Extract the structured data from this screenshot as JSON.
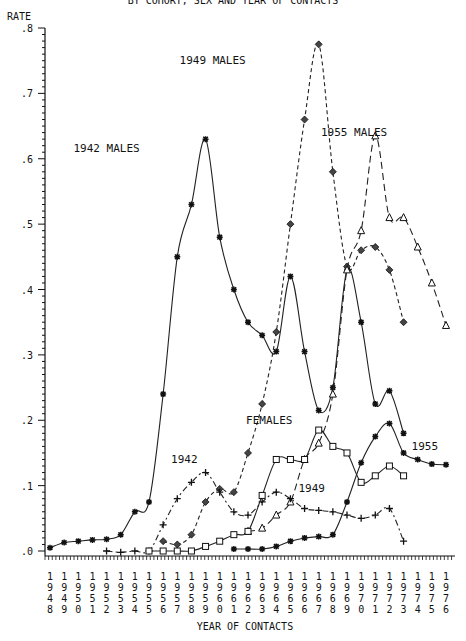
{
  "chart_data": {
    "type": "line",
    "title": "BY COHORT, SEX AND YEAR OF CONTACTS",
    "xlabel": "YEAR OF CONTACTS",
    "ylabel": "RATE",
    "ylim": [
      0,
      0.8
    ],
    "xlim": [
      1948,
      1976
    ],
    "grid": false,
    "y_ticks": [
      ".0",
      ".1",
      ".2",
      ".3",
      ".4",
      ".5",
      ".6",
      ".7",
      ".8"
    ],
    "x_ticks": [
      1948,
      1949,
      1950,
      1951,
      1952,
      1953,
      1954,
      1955,
      1956,
      1957,
      1958,
      1959,
      1960,
      1961,
      1962,
      1963,
      1964,
      1965,
      1966,
      1967,
      1968,
      1969,
      1970,
      1971,
      1972,
      1973,
      1974,
      1975,
      1976
    ],
    "annotations": [
      {
        "text": "1942 MALES",
        "x": 1952.0,
        "y": 0.61
      },
      {
        "text": "1949 MALES",
        "x": 1959.5,
        "y": 0.745
      },
      {
        "text": "1955 MALES",
        "x": 1969.5,
        "y": 0.635
      },
      {
        "text": "FEMALES",
        "x": 1963.5,
        "y": 0.195
      },
      {
        "text": "1942",
        "x": 1957.5,
        "y": 0.135
      },
      {
        "text": "1949",
        "x": 1966.5,
        "y": 0.09
      },
      {
        "text": "1955",
        "x": 1974.5,
        "y": 0.155
      }
    ],
    "series": [
      {
        "name": "1942 MALES",
        "style": "solid",
        "marker": "star",
        "x": [
          1948,
          1949,
          1950,
          1951,
          1952,
          1953,
          1954,
          1955,
          1956,
          1957,
          1958,
          1959,
          1960,
          1961,
          1962,
          1963,
          1964,
          1965,
          1966,
          1967,
          1968,
          1969,
          1970,
          1971,
          1972,
          1973
        ],
        "values": [
          0.005,
          0.013,
          0.015,
          0.017,
          0.018,
          0.025,
          0.06,
          0.075,
          0.24,
          0.45,
          0.53,
          0.63,
          0.48,
          0.4,
          0.35,
          0.33,
          0.305,
          0.42,
          0.305,
          0.215,
          0.25,
          0.43,
          0.35,
          0.225,
          0.245,
          0.18
        ]
      },
      {
        "name": "1949 MALES",
        "style": "dashed",
        "marker": "diamond",
        "x": [
          1956,
          1957,
          1958,
          1959,
          1960,
          1961,
          1962,
          1963,
          1964,
          1965,
          1966,
          1967,
          1968,
          1969,
          1970,
          1971,
          1972,
          1973
        ],
        "values": [
          0.015,
          0.01,
          0.025,
          0.075,
          0.095,
          0.09,
          0.15,
          0.225,
          0.335,
          0.5,
          0.66,
          0.775,
          0.58,
          0.435,
          0.46,
          0.465,
          0.43,
          0.35
        ]
      },
      {
        "name": "1955 MALES",
        "style": "long-dashed",
        "marker": "triangle",
        "x": [
          1962,
          1963,
          1964,
          1965,
          1966,
          1967,
          1968,
          1969,
          1970,
          1971,
          1972,
          1973,
          1974,
          1975,
          1976
        ],
        "values": [
          0.03,
          0.035,
          0.055,
          0.075,
          0.14,
          0.165,
          0.24,
          0.43,
          0.49,
          0.635,
          0.51,
          0.51,
          0.465,
          0.41,
          0.345
        ]
      },
      {
        "name": "1942 FEMALES",
        "style": "dash-dot",
        "marker": "plus",
        "x": [
          1952,
          1953,
          1954,
          1955,
          1956,
          1957,
          1958,
          1959,
          1960,
          1961,
          1962,
          1963,
          1964,
          1965,
          1966,
          1967,
          1968,
          1969,
          1970,
          1971,
          1972,
          1973
        ],
        "values": [
          0.0,
          -0.002,
          0.0,
          0.0,
          0.04,
          0.08,
          0.105,
          0.12,
          0.09,
          0.06,
          0.055,
          0.075,
          0.09,
          0.08,
          0.065,
          0.062,
          0.06,
          0.055,
          0.05,
          0.055,
          0.065,
          0.015
        ]
      },
      {
        "name": "1949 FEMALES",
        "style": "solid",
        "marker": "square",
        "x": [
          1955,
          1956,
          1957,
          1958,
          1959,
          1960,
          1961,
          1962,
          1963,
          1964,
          1965,
          1966,
          1967,
          1968,
          1969,
          1970,
          1971,
          1972,
          1973
        ],
        "values": [
          0.0,
          0.0,
          0.0,
          0.0,
          0.007,
          0.015,
          0.025,
          0.03,
          0.085,
          0.14,
          0.14,
          0.14,
          0.185,
          0.16,
          0.15,
          0.105,
          0.115,
          0.13,
          0.115
        ]
      },
      {
        "name": "1955 FEMALES",
        "style": "solid",
        "marker": "asterisk",
        "x": [
          1961,
          1962,
          1963,
          1964,
          1965,
          1966,
          1967,
          1968,
          1969,
          1970,
          1971,
          1972,
          1973,
          1974,
          1975,
          1976
        ],
        "values": [
          0.003,
          0.003,
          0.003,
          0.007,
          0.015,
          0.02,
          0.022,
          0.025,
          0.075,
          0.135,
          0.175,
          0.195,
          0.15,
          0.14,
          0.133,
          0.132
        ]
      }
    ]
  },
  "labels": {
    "title": "BY COHORT, SEX  AND YEAR OF CONTACTS",
    "ylabel": "RATE",
    "xlabel": "YEAR OF CONTACTS"
  }
}
